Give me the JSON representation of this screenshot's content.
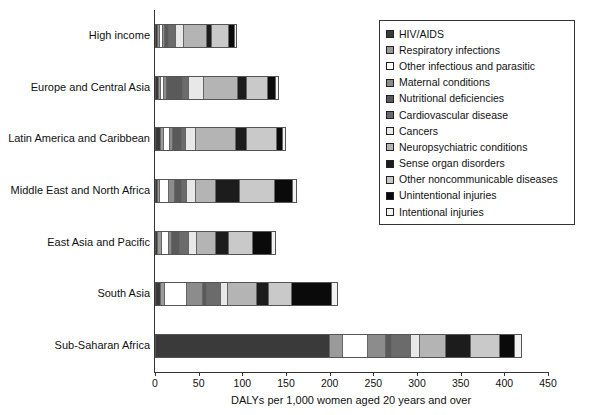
{
  "chart_data": {
    "type": "bar",
    "orientation": "horizontal",
    "stacked": true,
    "title": "",
    "xlabel": "DALYs per 1,000 women aged 20 years and over",
    "ylabel": "",
    "xlim": [
      0,
      450
    ],
    "xticks": [
      0,
      50,
      100,
      150,
      200,
      250,
      300,
      350,
      400,
      450
    ],
    "grid": false,
    "legend_position": "upper right",
    "categories": [
      "High income",
      "Europe and Central Asia",
      "Latin America and Caribbean",
      "Middle East and North Africa",
      "East Asia and Pacific",
      "South Asia",
      "Sub-Saharan Africa"
    ],
    "series": [
      {
        "name": "HIV/AIDS",
        "color": "#3a3a3a",
        "values": [
          1,
          2,
          5,
          1,
          1,
          5,
          205
        ]
      },
      {
        "name": "Respiratory infections",
        "color": "#9a9a9a",
        "values": [
          2,
          2,
          3,
          2,
          4,
          4,
          15
        ]
      },
      {
        "name": "Other infectious and parasitic",
        "color": "#ffffff",
        "values": [
          3,
          3,
          6,
          10,
          8,
          25,
          28
        ]
      },
      {
        "name": "Maternal conditions",
        "color": "#8c8c8c",
        "values": [
          1,
          2,
          3,
          6,
          3,
          19,
          20
        ]
      },
      {
        "name": "Nutritional deficiencies",
        "color": "#5a5a5a",
        "values": [
          4,
          19,
          10,
          8,
          8,
          4,
          6
        ]
      },
      {
        "name": "Cardiovascular disease",
        "color": "#6b6b6b",
        "values": [
          8,
          7,
          4,
          4,
          10,
          16,
          22
        ]
      },
      {
        "name": "Cancers",
        "color": "#e8e8e8",
        "values": [
          9,
          17,
          11,
          10,
          10,
          7,
          9
        ]
      },
      {
        "name": "Neuropsychiatric conditions",
        "color": "#b4b4b4",
        "values": [
          31,
          43,
          50,
          25,
          23,
          35,
          30
        ]
      },
      {
        "name": "Sense organ disorders",
        "color": "#1c1c1c",
        "values": [
          5,
          10,
          12,
          28,
          15,
          13,
          28
        ]
      },
      {
        "name": "Other noncommunicable diseases",
        "color": "#c9c9c9",
        "values": [
          22,
          26,
          37,
          43,
          29,
          27,
          33
        ]
      },
      {
        "name": "Unintentional injuries",
        "color": "#0a0a0a",
        "values": [
          6,
          9,
          7,
          22,
          24,
          48,
          17
        ]
      },
      {
        "name": "Intentional injuries",
        "color": "#f2f2f2",
        "values": [
          2,
          2,
          2,
          4,
          3,
          7,
          7
        ]
      }
    ],
    "totals": [
      94,
      142,
      150,
      163,
      138,
      210,
      420
    ]
  },
  "legend": {
    "items": [
      {
        "label": "HIV/AIDS",
        "color": "#3a3a3a"
      },
      {
        "label": "Respiratory infections",
        "color": "#9a9a9a"
      },
      {
        "label": "Other infectious and parasitic",
        "color": "#ffffff"
      },
      {
        "label": "Maternal conditions",
        "color": "#8c8c8c"
      },
      {
        "label": "Nutritional deficiencies",
        "color": "#5a5a5a"
      },
      {
        "label": "Cardiovascular disease",
        "color": "#6b6b6b"
      },
      {
        "label": "Cancers",
        "color": "#e8e8e8"
      },
      {
        "label": "Neuropsychiatric conditions",
        "color": "#b4b4b4"
      },
      {
        "label": "Sense organ disorders",
        "color": "#1c1c1c"
      },
      {
        "label": "Other noncommunicable diseases",
        "color": "#c9c9c9"
      },
      {
        "label": "Unintentional injuries",
        "color": "#0a0a0a"
      },
      {
        "label": "Intentional injuries",
        "color": "#f2f2f2"
      }
    ]
  }
}
